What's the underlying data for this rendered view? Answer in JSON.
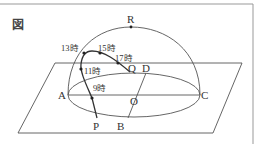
{
  "figure": {
    "label": "図",
    "points": {
      "R": "R",
      "A": "A",
      "C": "C",
      "O": "O",
      "P": "P",
      "B": "B",
      "Q": "Q",
      "D": "D"
    },
    "times": {
      "t9": "9時",
      "t11": "11時",
      "t13": "13時",
      "t15": "15時",
      "t17": "17時"
    }
  },
  "colors": {
    "line": "#555555",
    "text": "#333333",
    "border": "#888888"
  }
}
